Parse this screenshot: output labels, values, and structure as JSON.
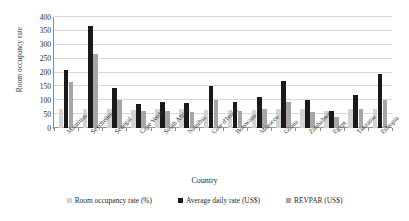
{
  "chart_data": {
    "type": "bar",
    "title": "",
    "xlabel": "Country",
    "ylabel": "Room occupancy rate",
    "ylim": [
      0,
      400
    ],
    "yticks": [
      0,
      50,
      100,
      150,
      200,
      250,
      300,
      350,
      400
    ],
    "grid": "horizontal",
    "legend_position": "bottom",
    "categories": [
      "Mauritius",
      "Seychelles",
      "Senegal",
      "Cape Verde",
      "South Africa",
      "Namibia",
      "Cote d'Ivoire",
      "Botswana",
      "Morocco",
      "Ghana",
      "Zimbabwe",
      "Egypt",
      "Tanzania",
      "Ethiopia"
    ],
    "series": [
      {
        "name": "Room occupancy rate (%)",
        "color": "#d3d3d3",
        "values": [
          70,
          70,
          68,
          66,
          70,
          68,
          66,
          66,
          66,
          68,
          70,
          62,
          70,
          70
        ]
      },
      {
        "name": "Average daily rate  (US$)",
        "color": "#1a1a1a",
        "values": [
          208,
          368,
          145,
          88,
          92,
          90,
          152,
          92,
          110,
          170,
          100,
          60,
          118,
          195
        ]
      },
      {
        "name": "REVPAR (US$)",
        "color": "#a6a6a6",
        "values": [
          165,
          268,
          102,
          60,
          62,
          58,
          100,
          60,
          68,
          92,
          58,
          40,
          70,
          102
        ]
      }
    ]
  },
  "legend": {
    "items": [
      {
        "label": "Room occupancy rate (%)",
        "color": "#d3d3d3"
      },
      {
        "label": "Average daily rate  (US$)",
        "color": "#1a1a1a"
      },
      {
        "label": "REVPAR (US$)",
        "color": "#a6a6a6"
      }
    ]
  }
}
